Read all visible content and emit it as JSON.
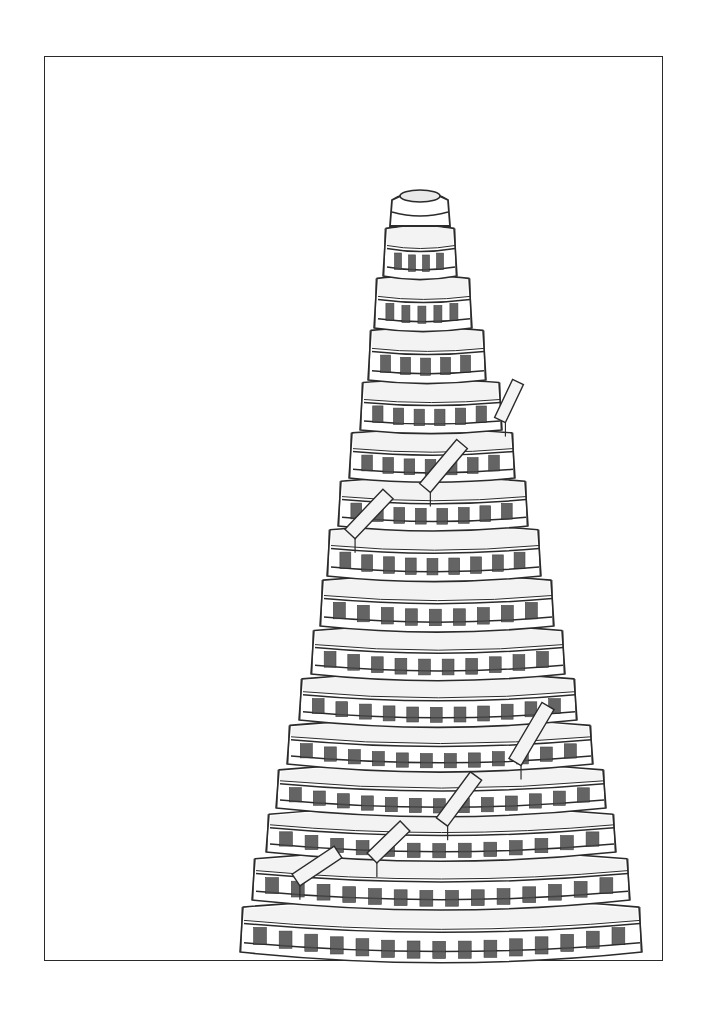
{
  "artwork": {
    "title": "Pencil sketch of a tiered conical tower",
    "caption": "Tower sketch",
    "palette": {
      "paper": "#ffffff",
      "line": "#2b2b2b",
      "window": "#4a4a4a",
      "shade": "#e9e9e9",
      "frame": "#2a2a2a"
    },
    "frame": {
      "x": 44,
      "y": 56,
      "width": 619,
      "height": 905
    },
    "cap": {
      "cx": 420,
      "top": 190,
      "bottom": 226,
      "halfWidth": 30,
      "rimRx": 20,
      "rimRy": 6
    },
    "tiers": [
      {
        "y": 226,
        "h": 50,
        "cx": 420,
        "hw": 34,
        "windows": 4
      },
      {
        "y": 276,
        "h": 52,
        "cx": 423,
        "hw": 46,
        "windows": 5
      },
      {
        "y": 328,
        "h": 52,
        "cx": 427,
        "hw": 56,
        "windows": 5
      },
      {
        "y": 380,
        "h": 50,
        "cx": 431,
        "hw": 68,
        "windows": 6
      },
      {
        "y": 430,
        "h": 48,
        "cx": 432,
        "hw": 80,
        "windows": 7
      },
      {
        "y": 478,
        "h": 48,
        "cx": 433,
        "hw": 92,
        "windows": 8
      },
      {
        "y": 526,
        "h": 50,
        "cx": 434,
        "hw": 104,
        "windows": 9
      },
      {
        "y": 576,
        "h": 50,
        "cx": 437,
        "hw": 114,
        "windows": 9
      },
      {
        "y": 626,
        "h": 48,
        "cx": 438,
        "hw": 124,
        "windows": 10
      },
      {
        "y": 674,
        "h": 46,
        "cx": 438,
        "hw": 136,
        "windows": 11
      },
      {
        "y": 720,
        "h": 44,
        "cx": 440,
        "hw": 150,
        "windows": 12
      },
      {
        "y": 764,
        "h": 44,
        "cx": 441,
        "hw": 162,
        "windows": 13
      },
      {
        "y": 808,
        "h": 44,
        "cx": 441,
        "hw": 172,
        "windows": 13
      },
      {
        "y": 852,
        "h": 48,
        "cx": 441,
        "hw": 186,
        "windows": 14
      },
      {
        "y": 900,
        "h": 52,
        "cx": 441,
        "hw": 198,
        "windows": 15
      }
    ],
    "ramps": [
      {
        "x1": 500,
        "y1": 420,
        "x2": 518,
        "y2": 382,
        "w": 12
      },
      {
        "x1": 425,
        "y1": 488,
        "x2": 462,
        "y2": 444,
        "w": 14
      },
      {
        "x1": 350,
        "y1": 534,
        "x2": 388,
        "y2": 494,
        "w": 14
      },
      {
        "x1": 515,
        "y1": 762,
        "x2": 548,
        "y2": 706,
        "w": 14
      },
      {
        "x1": 442,
        "y1": 822,
        "x2": 476,
        "y2": 776,
        "w": 14
      },
      {
        "x1": 372,
        "y1": 858,
        "x2": 405,
        "y2": 826,
        "w": 14
      },
      {
        "x1": 296,
        "y1": 880,
        "x2": 338,
        "y2": 852,
        "w": 14
      }
    ]
  }
}
